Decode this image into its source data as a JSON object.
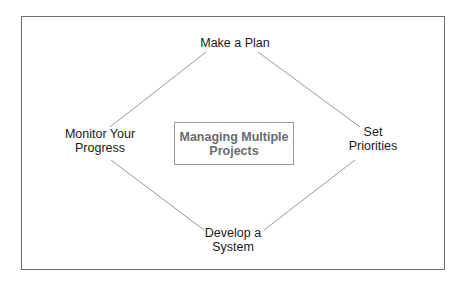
{
  "diagram": {
    "center": {
      "line1": "Managing Multiple",
      "line2": "Projects"
    },
    "nodes": {
      "top": {
        "line1": "Make a Plan"
      },
      "right": {
        "line1": "Set",
        "line2": "Priorities"
      },
      "bottom": {
        "line1": "Develop a",
        "line2": "System"
      },
      "left": {
        "line1": "Monitor Your",
        "line2": "Progress"
      }
    },
    "colors": {
      "frame": "#6e6e6e",
      "lines": "#9a9a9a",
      "center_text": "#6b6b6b",
      "node_text": "#1a1a1a"
    }
  }
}
